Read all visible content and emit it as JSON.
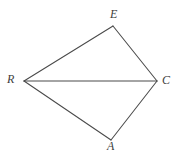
{
  "figure": {
    "name": "quadrilateral-REAC-with-diagonal",
    "background_color": "#ffffff",
    "line_color": "#4a4a4a",
    "label_color": "#3d3d3d",
    "width": 178,
    "height": 151,
    "vertices": [
      {
        "id": "E",
        "label": "E",
        "x": 113,
        "y": 26
      },
      {
        "id": "R",
        "label": "R",
        "x": 24,
        "y": 81
      },
      {
        "id": "C",
        "label": "C",
        "x": 157,
        "y": 81
      },
      {
        "id": "A",
        "label": "A",
        "x": 111,
        "y": 140
      }
    ],
    "edges": [
      {
        "id": "R-E",
        "from": "R",
        "to": "E"
      },
      {
        "id": "E-C",
        "from": "E",
        "to": "C"
      },
      {
        "id": "R-C",
        "from": "R",
        "to": "C"
      },
      {
        "id": "R-A",
        "from": "R",
        "to": "A"
      },
      {
        "id": "A-C",
        "from": "A",
        "to": "C"
      }
    ],
    "labels": {
      "E": "E",
      "R": "R",
      "C": "C",
      "A": "A"
    }
  }
}
